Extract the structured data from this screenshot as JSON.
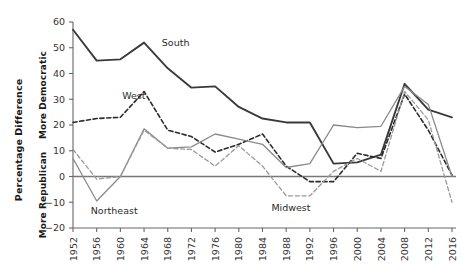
{
  "chart_data": {
    "type": "line",
    "title": "",
    "xlabel": "",
    "ylabel": "Percentage Difference",
    "ylabel_upper": "More Democratic",
    "ylabel_lower": "More Republican",
    "categories": [
      "1952",
      "1956",
      "1960",
      "1964",
      "1968",
      "1972",
      "1976",
      "1980",
      "1984",
      "1988",
      "1992",
      "1996",
      "2000",
      "2004",
      "2008",
      "2012",
      "2016"
    ],
    "x": [
      1952,
      1956,
      1960,
      1964,
      1968,
      1972,
      1976,
      1980,
      1984,
      1988,
      1992,
      1996,
      2000,
      2004,
      2008,
      2012,
      2016
    ],
    "ylim": [
      -20,
      60
    ],
    "xlim": [
      1952,
      2016
    ],
    "yticks": [
      -20,
      -10,
      0,
      10,
      20,
      30,
      40,
      50,
      60
    ],
    "ytick_labels": [
      "−20",
      "−10",
      "0",
      "10",
      "20",
      "30",
      "40",
      "50",
      "60"
    ],
    "grid": false,
    "legend_position": "inline-annotations",
    "zero_line": 0,
    "series": [
      {
        "name": "South",
        "style": "solid",
        "color": "#3a3a3a",
        "width": 1.9,
        "values": [
          57,
          45,
          45.5,
          52,
          42,
          34.5,
          35,
          27,
          22.5,
          21,
          21,
          5,
          5.5,
          8.5,
          36,
          26,
          23
        ]
      },
      {
        "name": "West",
        "style": "dashed",
        "color": "#2b2b2b",
        "width": 1.6,
        "values": [
          21,
          22.5,
          23,
          33,
          18,
          15.5,
          9.5,
          12.5,
          16.5,
          4,
          -2,
          -2,
          9,
          7,
          32,
          18,
          0.5
        ]
      },
      {
        "name": "Northeast",
        "style": "solid",
        "color": "#8a8a8a",
        "width": 1.3,
        "values": [
          7,
          -9.5,
          0,
          18.5,
          11,
          11.5,
          16.5,
          14.5,
          12.5,
          3.5,
          5,
          20,
          19,
          19.5,
          35,
          28,
          0
        ]
      },
      {
        "name": "Midwest",
        "style": "dashed",
        "color": "#9a9a9a",
        "width": 1.3,
        "values": [
          10.5,
          -1,
          0,
          18,
          11,
          10.5,
          4,
          12,
          4,
          -7.5,
          -7.5,
          2,
          7,
          2,
          33,
          22,
          -10
        ]
      }
    ],
    "annotations": [
      {
        "text": "South",
        "x": 1967,
        "y": 50.5,
        "anchor": "start"
      },
      {
        "text": "West",
        "x": 1960.3,
        "y": 30.0,
        "anchor": "start"
      },
      {
        "text": "Northeast",
        "x": 1955.0,
        "y": -14.5,
        "anchor": "start"
      },
      {
        "text": "Midwest",
        "x": 1985.5,
        "y": -13.5,
        "anchor": "start"
      }
    ]
  }
}
